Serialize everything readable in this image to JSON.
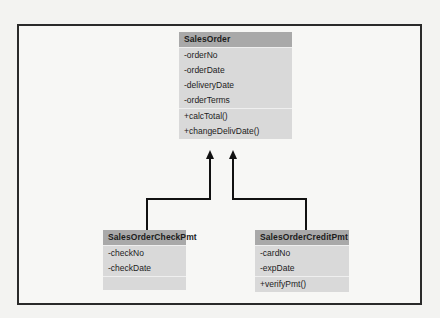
{
  "diagram": {
    "type": "uml-class-diagram",
    "relationship": "generalization",
    "classes": [
      {
        "name": "SalesOrder",
        "attributes": [
          "-orderNo",
          "-orderDate",
          "-deliveryDate",
          "-orderTerms"
        ],
        "operations": [
          "+calcTotal()",
          "+changeDelivDate()"
        ]
      },
      {
        "name": "SalesOrderCheckPmt",
        "attributes": [
          "-checkNo",
          "-checkDate"
        ],
        "operations": []
      },
      {
        "name": "SalesOrderCreditPmt",
        "attributes": [
          "-cardNo",
          "-expDate"
        ],
        "operations": [
          "+verifyPmt()"
        ]
      }
    ],
    "links": [
      {
        "from": "SalesOrderCheckPmt",
        "to": "SalesOrder",
        "kind": "inheritance"
      },
      {
        "from": "SalesOrderCreditPmt",
        "to": "SalesOrder",
        "kind": "inheritance"
      }
    ]
  },
  "colors": {
    "header": "#a9a9a9",
    "body": "#d9d9d9",
    "line": "#111111",
    "frame": "#2a2a2a"
  }
}
